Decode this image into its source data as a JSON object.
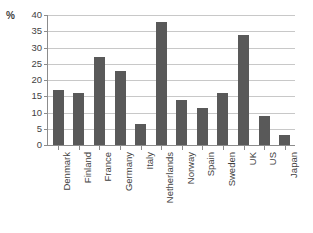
{
  "chart_data": {
    "type": "bar",
    "title": "",
    "subtitle": "",
    "xlabel": "",
    "ylabel": "%",
    "ylim": [
      0,
      40
    ],
    "ytick_step": 5,
    "yticks": [
      "0",
      "5",
      "10",
      "15",
      "20",
      "25",
      "30",
      "35",
      "40"
    ],
    "grid": true,
    "legend": false,
    "legend_position": "none",
    "bar_color": "#595959",
    "gridline_color": "#c8c8c8",
    "axis_color": "#8c8c8c",
    "categories": [
      "Denmark",
      "Finland",
      "France",
      "Germany",
      "Italy",
      "Netherlands",
      "Norway",
      "Spain",
      "Sweden",
      "UK",
      "US",
      "Japan"
    ],
    "values": [
      17,
      16,
      27,
      22.7,
      6.5,
      38,
      13.8,
      11.3,
      16,
      34,
      9,
      3
    ]
  }
}
